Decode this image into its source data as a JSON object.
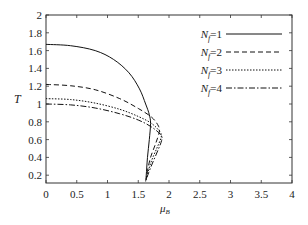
{
  "chart_data": {
    "type": "line",
    "title": "",
    "xlabel": "μ_B",
    "ylabel": "T",
    "xlim": [
      0,
      4
    ],
    "ylim": [
      0.13,
      2
    ],
    "grid": false,
    "legend_position": "upper right (inside)",
    "x_ticks": [
      "0",
      "0.5",
      "1",
      "1.5",
      "2",
      "2.5",
      "3",
      "3.5",
      "4"
    ],
    "y_ticks": [
      "0.2",
      "0.4",
      "0.6",
      "0.8",
      "1",
      "1.2",
      "1.4",
      "1.6",
      "1.8",
      "2"
    ],
    "series": [
      {
        "name": "N_f=1",
        "style": "solid",
        "points": [
          [
            0,
            1.67
          ],
          [
            0.4,
            1.655
          ],
          [
            0.8,
            1.6
          ],
          [
            1.1,
            1.5
          ],
          [
            1.35,
            1.35
          ],
          [
            1.52,
            1.17
          ],
          [
            1.62,
            1.0
          ],
          [
            1.68,
            0.88
          ],
          [
            1.7,
            0.78
          ],
          [
            1.68,
            0.6
          ],
          [
            1.65,
            0.4
          ],
          [
            1.63,
            0.2
          ],
          [
            1.62,
            0.13
          ]
        ]
      },
      {
        "name": "N_f=2",
        "style": "dashed",
        "points": [
          [
            0,
            1.22
          ],
          [
            0.4,
            1.205
          ],
          [
            0.8,
            1.16
          ],
          [
            1.2,
            1.06
          ],
          [
            1.5,
            0.95
          ],
          [
            1.72,
            0.85
          ],
          [
            1.83,
            0.75
          ],
          [
            1.84,
            0.68
          ],
          [
            1.78,
            0.55
          ],
          [
            1.7,
            0.4
          ],
          [
            1.65,
            0.25
          ],
          [
            1.63,
            0.15
          ]
        ]
      },
      {
        "name": "N_f=3",
        "style": "dotted",
        "points": [
          [
            0,
            1.06
          ],
          [
            0.4,
            1.05
          ],
          [
            0.8,
            1.01
          ],
          [
            1.2,
            0.94
          ],
          [
            1.5,
            0.86
          ],
          [
            1.72,
            0.78
          ],
          [
            1.86,
            0.68
          ],
          [
            1.87,
            0.62
          ],
          [
            1.8,
            0.5
          ],
          [
            1.72,
            0.37
          ],
          [
            1.66,
            0.24
          ],
          [
            1.63,
            0.15
          ]
        ]
      },
      {
        "name": "N_f=4",
        "style": "dashdot",
        "points": [
          [
            0,
            1.0
          ],
          [
            0.4,
            0.99
          ],
          [
            0.8,
            0.955
          ],
          [
            1.2,
            0.89
          ],
          [
            1.5,
            0.82
          ],
          [
            1.72,
            0.74
          ],
          [
            1.87,
            0.65
          ],
          [
            1.88,
            0.59
          ],
          [
            1.82,
            0.48
          ],
          [
            1.74,
            0.35
          ],
          [
            1.67,
            0.23
          ],
          [
            1.63,
            0.15
          ]
        ]
      }
    ]
  },
  "legend": {
    "items": [
      {
        "prefix": "N",
        "sub": "f",
        "suffix": "=1",
        "style": "solid"
      },
      {
        "prefix": "N",
        "sub": "f",
        "suffix": "=2",
        "style": "dashed"
      },
      {
        "prefix": "N",
        "sub": "f",
        "suffix": "=3",
        "style": "dotted"
      },
      {
        "prefix": "N",
        "sub": "f",
        "suffix": "=4",
        "style": "dashdot"
      }
    ]
  },
  "axes": {
    "xlabel_main": "μ",
    "xlabel_sub": "B",
    "ylabel": "T"
  },
  "colors": {
    "line": "#111111",
    "axis": "#333333"
  }
}
